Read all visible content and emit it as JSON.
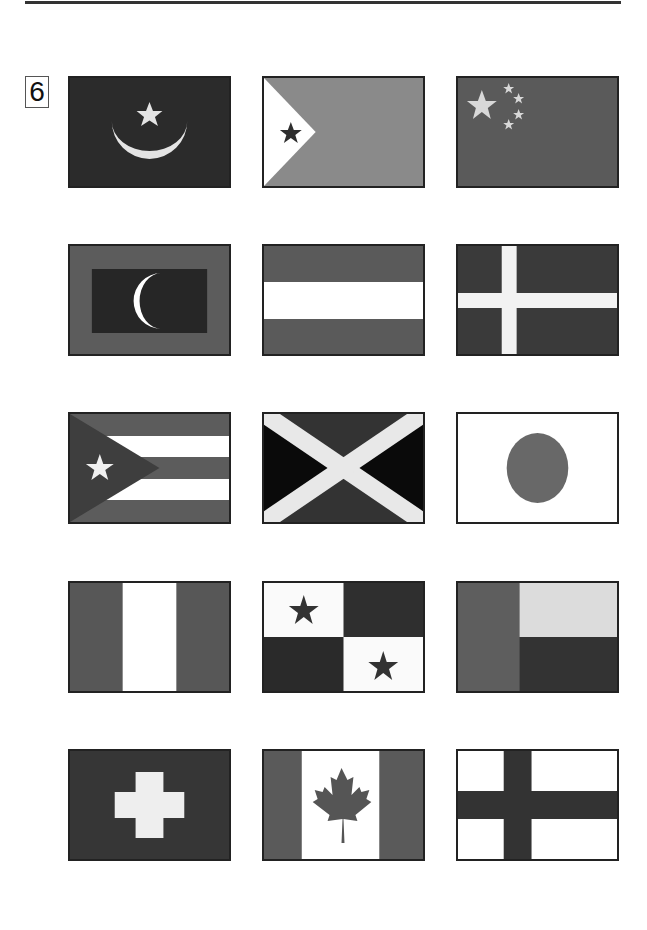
{
  "page": {
    "section_number": "6"
  },
  "colors": {
    "dark": "#2e2e2e",
    "darker": "#1a1a1a",
    "mid": "#5a5a5a",
    "light_mid": "#8a8a8a",
    "light": "#e6e6e6",
    "white": "#ffffff",
    "border": "#222222"
  },
  "flags": [
    {
      "row": 1,
      "col": 1,
      "design": "dark field with light crescent and star (Mauritania)"
    },
    {
      "row": 1,
      "col": 2,
      "design": "white hoist triangle with dark star, gray field (Djibouti)"
    },
    {
      "row": 1,
      "col": 3,
      "design": "gray field with one large and four small light stars (China)"
    },
    {
      "row": 2,
      "col": 1,
      "design": "gray border, dark rectangle with white crescent (Maldives)"
    },
    {
      "row": 2,
      "col": 2,
      "design": "gray-white-gray horizontal triband (Austria)"
    },
    {
      "row": 2,
      "col": 3,
      "design": "dark field with light Nordic cross (Denmark)"
    },
    {
      "row": 3,
      "col": 1,
      "design": "gray/white stripes with dark hoist triangle and white star (Cuba)"
    },
    {
      "row": 3,
      "col": 2,
      "design": "light saltire with dark and black triangles (Jamaica)"
    },
    {
      "row": 3,
      "col": 3,
      "design": "white field with gray disc (Japan)"
    },
    {
      "row": 4,
      "col": 1,
      "design": "gray-white-gray vertical triband (Nigeria)"
    },
    {
      "row": 4,
      "col": 2,
      "design": "quartered white/dark with two dark stars (Panama)"
    },
    {
      "row": 4,
      "col": 3,
      "design": "gray hoist band, light top, dark bottom (Benin)"
    },
    {
      "row": 5,
      "col": 1,
      "design": "dark field with light cross (Switzerland)"
    },
    {
      "row": 5,
      "col": 2,
      "design": "gray side bands, white center with gray maple leaf (Canada)"
    },
    {
      "row": 5,
      "col": 3,
      "design": "white field with dark Nordic cross (Finland)"
    }
  ]
}
